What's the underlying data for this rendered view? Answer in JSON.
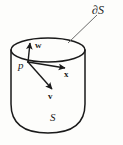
{
  "figure": {
    "kind": "math-diagram",
    "width": 123,
    "height": 145,
    "background_color": "#fdfdfb",
    "ink_color": "#1a1a1a",
    "leader_color": "#6b6b6b"
  },
  "labels": {
    "boundary": "∂S",
    "point": "p",
    "surface": "S",
    "vector_w": "w",
    "vector_x": "x",
    "vector_v": "v"
  },
  "geometry": {
    "rim_ellipse": {
      "cx": 48,
      "cy": 50,
      "rx": 37,
      "ry": 12
    },
    "body": {
      "left_x": 11,
      "right_x": 85,
      "top_y": 50,
      "bottom_y": 133
    },
    "point_p": {
      "x": 28,
      "y": 62
    },
    "vectors": [
      {
        "name": "w",
        "from": [
          28,
          62
        ],
        "to": [
          30,
          43
        ]
      },
      {
        "name": "x",
        "from": [
          28,
          62
        ],
        "to": [
          66,
          68
        ]
      },
      {
        "name": "v",
        "from": [
          28,
          62
        ],
        "to": [
          53,
          90
        ]
      }
    ],
    "leader_line": {
      "from": [
        68,
        43
      ],
      "to": [
        97,
        15
      ]
    }
  }
}
